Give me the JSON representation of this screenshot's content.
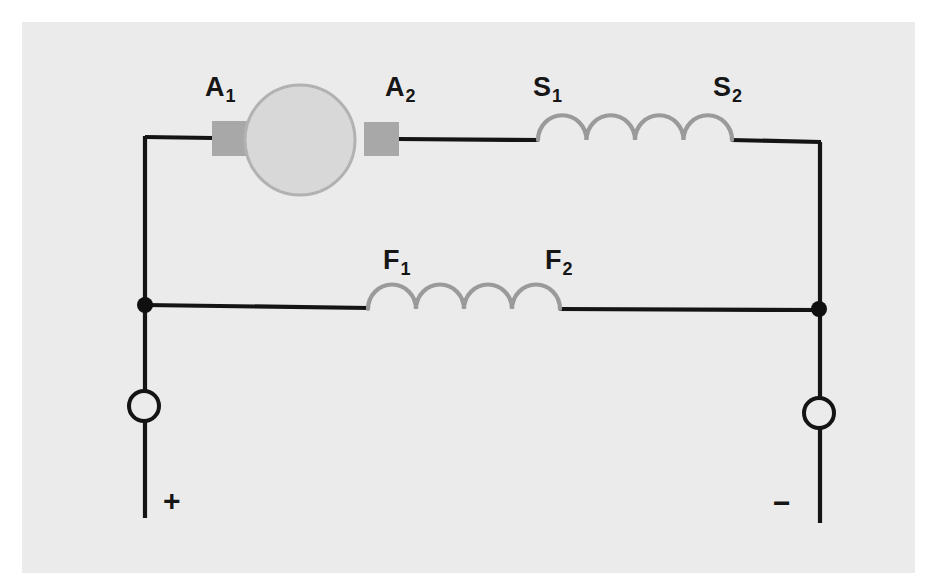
{
  "diagram": {
    "paper": {
      "background_color": "#ebebeb",
      "margin_color": "#ffffff"
    },
    "colors": {
      "wire": "#141414",
      "coil": "#9a9a9a",
      "armature_fill": "#d8d8d8",
      "armature_stroke": "#b2b2b2",
      "brush_fill": "#a8a8a8",
      "node_dot": "#101010",
      "terminal_stroke": "#141414",
      "terminal_fill": "#ebebeb",
      "label_text": "#161616"
    },
    "labels": {
      "armature_left": {
        "base": "A",
        "sub": "1"
      },
      "armature_right": {
        "base": "A",
        "sub": "2"
      },
      "series_left": {
        "base": "S",
        "sub": "1"
      },
      "series_right": {
        "base": "S",
        "sub": "2"
      },
      "shunt_left": {
        "base": "F",
        "sub": "1"
      },
      "shunt_right": {
        "base": "F",
        "sub": "2"
      },
      "positive_terminal": "+",
      "negative_terminal": "−"
    },
    "components": {
      "armature": {
        "name": "armature",
        "shape": "circle",
        "center_x": 300,
        "center_y": 140,
        "radius": 55
      },
      "brush_left": {
        "x": 212,
        "y": 121,
        "width": 39,
        "height": 35
      },
      "brush_right": {
        "x": 364,
        "y": 122,
        "width": 35,
        "height": 34
      },
      "series_coil": {
        "name": "series-field-winding",
        "humps": 4,
        "x_start": 538,
        "x_end": 732,
        "baseline_y": 140
      },
      "shunt_coil": {
        "name": "shunt-field-winding",
        "humps": 4,
        "x_start": 368,
        "x_end": 560,
        "baseline_y": 309
      },
      "junction_left": {
        "x": 145,
        "y": 305,
        "radius": 8
      },
      "junction_right": {
        "x": 819,
        "y": 309,
        "radius": 8
      },
      "terminal_positive": {
        "x": 144,
        "y": 406,
        "radius": 15
      },
      "terminal_negative": {
        "x": 819,
        "y": 413,
        "radius": 15
      }
    }
  }
}
